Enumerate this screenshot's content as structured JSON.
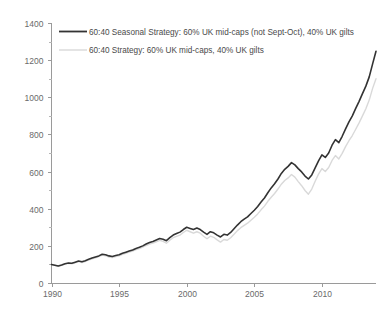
{
  "chart_data": {
    "type": "line",
    "title": "",
    "subtitle": "",
    "xlabel": "",
    "ylabel": "",
    "xlim": [
      1990,
      2014
    ],
    "ylim": [
      0,
      1400
    ],
    "grid": false,
    "legend_position": "top-left",
    "x_ticks": [
      "1990",
      "1995",
      "2000",
      "2005",
      "2010"
    ],
    "x_tick_values": [
      1990,
      1995,
      2000,
      2005,
      2010
    ],
    "x_minor_step": 1,
    "y_ticks": [
      "0",
      "200",
      "400",
      "600",
      "800",
      "1000",
      "1200",
      "1400"
    ],
    "y_tick_values": [
      0,
      200,
      400,
      600,
      800,
      1000,
      1200,
      1400
    ],
    "y_minor_step": 100,
    "series": [
      {
        "name": "60:40 Seasonal Strategy: 60% UK mid-caps (not Sept-Oct), 40% UK gilts",
        "color": "#333333",
        "width": 1.6,
        "x": [
          1990.0,
          1990.25,
          1990.5,
          1990.75,
          1991.0,
          1991.25,
          1991.5,
          1991.75,
          1992.0,
          1992.25,
          1992.5,
          1992.75,
          1993.0,
          1993.25,
          1993.5,
          1993.75,
          1994.0,
          1994.25,
          1994.5,
          1994.75,
          1995.0,
          1995.25,
          1995.5,
          1995.75,
          1996.0,
          1996.25,
          1996.5,
          1996.75,
          1997.0,
          1997.25,
          1997.5,
          1997.75,
          1998.0,
          1998.25,
          1998.5,
          1998.75,
          1999.0,
          1999.25,
          1999.5,
          1999.75,
          2000.0,
          2000.25,
          2000.5,
          2000.75,
          2001.0,
          2001.25,
          2001.5,
          2001.75,
          2002.0,
          2002.25,
          2002.5,
          2002.75,
          2003.0,
          2003.25,
          2003.5,
          2003.75,
          2004.0,
          2004.25,
          2004.5,
          2004.75,
          2005.0,
          2005.25,
          2005.5,
          2005.75,
          2006.0,
          2006.25,
          2006.5,
          2006.75,
          2007.0,
          2007.25,
          2007.5,
          2007.75,
          2008.0,
          2008.25,
          2008.5,
          2008.75,
          2009.0,
          2009.25,
          2009.5,
          2009.75,
          2010.0,
          2010.25,
          2010.5,
          2010.75,
          2011.0,
          2011.25,
          2011.5,
          2011.75,
          2012.0,
          2012.25,
          2012.5,
          2012.75,
          2013.0,
          2013.25,
          2013.5,
          2013.75,
          2014.0
        ],
        "y": [
          100,
          96,
          92,
          97,
          104,
          108,
          106,
          112,
          118,
          114,
          120,
          128,
          134,
          140,
          146,
          155,
          152,
          146,
          143,
          148,
          152,
          160,
          166,
          172,
          178,
          186,
          192,
          200,
          210,
          218,
          224,
          232,
          240,
          236,
          228,
          244,
          258,
          266,
          274,
          288,
          300,
          294,
          288,
          296,
          288,
          274,
          262,
          276,
          270,
          258,
          248,
          262,
          258,
          272,
          292,
          312,
          330,
          344,
          356,
          374,
          392,
          412,
          436,
          458,
          486,
          512,
          534,
          560,
          590,
          612,
          628,
          648,
          636,
          616,
          598,
          576,
          560,
          582,
          620,
          658,
          690,
          676,
          700,
          742,
          772,
          756,
          790,
          830,
          868,
          900,
          940,
          978,
          1020,
          1060,
          1110,
          1180,
          1248
        ]
      },
      {
        "name": "60:40 Strategy: 60% UK mid-caps, 40% UK gilts",
        "color": "#d9d9d9",
        "width": 1.4,
        "x": [
          1990.0,
          1990.25,
          1990.5,
          1990.75,
          1991.0,
          1991.25,
          1991.5,
          1991.75,
          1992.0,
          1992.25,
          1992.5,
          1992.75,
          1993.0,
          1993.25,
          1993.5,
          1993.75,
          1994.0,
          1994.25,
          1994.5,
          1994.75,
          1995.0,
          1995.25,
          1995.5,
          1995.75,
          1996.0,
          1996.25,
          1996.5,
          1996.75,
          1997.0,
          1997.25,
          1997.5,
          1997.75,
          1998.0,
          1998.25,
          1998.5,
          1998.75,
          1999.0,
          1999.25,
          1999.5,
          1999.75,
          2000.0,
          2000.25,
          2000.5,
          2000.75,
          2001.0,
          2001.25,
          2001.5,
          2001.75,
          2002.0,
          2002.25,
          2002.5,
          2002.75,
          2003.0,
          2003.25,
          2003.5,
          2003.75,
          2004.0,
          2004.25,
          2004.5,
          2004.75,
          2005.0,
          2005.25,
          2005.5,
          2005.75,
          2006.0,
          2006.25,
          2006.5,
          2006.75,
          2007.0,
          2007.25,
          2007.5,
          2007.75,
          2008.0,
          2008.25,
          2008.5,
          2008.75,
          2009.0,
          2009.25,
          2009.5,
          2009.75,
          2010.0,
          2010.25,
          2010.5,
          2010.75,
          2011.0,
          2011.25,
          2011.5,
          2011.75,
          2012.0,
          2012.25,
          2012.5,
          2012.75,
          2013.0,
          2013.25,
          2013.5,
          2013.75,
          2014.0
        ],
        "y": [
          100,
          95,
          90,
          95,
          102,
          106,
          103,
          109,
          115,
          110,
          116,
          124,
          130,
          136,
          142,
          150,
          147,
          140,
          137,
          142,
          146,
          154,
          160,
          166,
          172,
          180,
          185,
          193,
          202,
          210,
          215,
          222,
          230,
          224,
          214,
          230,
          244,
          251,
          258,
          272,
          284,
          276,
          268,
          276,
          268,
          252,
          238,
          252,
          246,
          232,
          220,
          234,
          230,
          244,
          262,
          282,
          298,
          310,
          322,
          338,
          354,
          372,
          394,
          414,
          440,
          462,
          482,
          506,
          532,
          552,
          566,
          584,
          570,
          546,
          524,
          498,
          478,
          506,
          548,
          586,
          616,
          600,
          622,
          660,
          686,
          668,
          698,
          734,
          766,
          794,
          828,
          862,
          900,
          938,
          985,
          1048,
          1100
        ]
      }
    ],
    "legend": [
      {
        "label": "60:40 Seasonal Strategy: 60% UK mid-caps (not Sept-Oct), 40% UK gilts",
        "color": "#333333",
        "width": 1.8
      },
      {
        "label": "60:40 Strategy: 60% UK mid-caps, 40% UK gilts",
        "color": "#d9d9d9",
        "width": 1.4
      }
    ]
  },
  "axis_color": "#9a9a9a",
  "tick_label_color": "#6a6a6a",
  "legend_text_color": "#4a4a4a",
  "background": "#ffffff"
}
